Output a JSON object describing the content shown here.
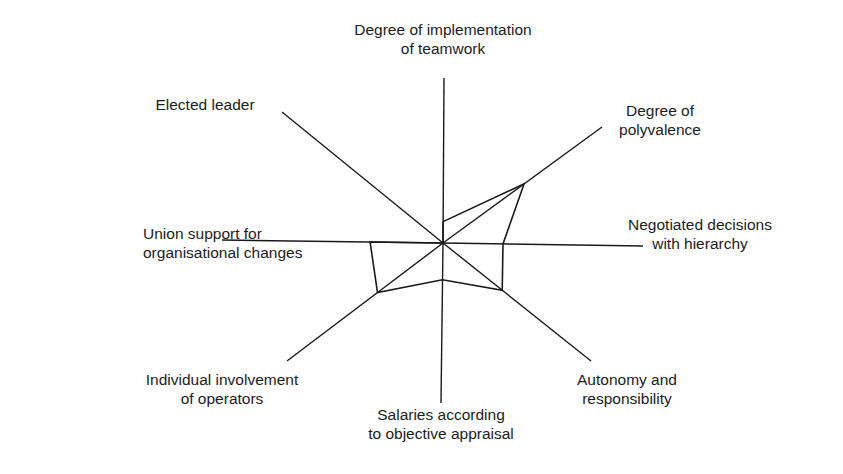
{
  "chart_data": {
    "type": "radar",
    "title": "",
    "center": [
      443,
      243
    ],
    "axes": [
      {
        "name": "Degree of implementation of teamwork",
        "lines": [
          "Degree of implementation",
          "of teamwork"
        ],
        "end": [
          444,
          78
        ],
        "value": 0.13,
        "label_pos": [
          443,
          20
        ],
        "align": "center"
      },
      {
        "name": "Degree of polyvalence",
        "lines": [
          "Degree of",
          "polyvalence"
        ],
        "end": [
          602,
          127
        ],
        "value": 0.51,
        "label_pos": [
          660,
          101
        ],
        "align": "center"
      },
      {
        "name": "Negotiated decisions with hierarchy",
        "lines": [
          "Negotiated decisions",
          "with hierarchy"
        ],
        "end": [
          643,
          246
        ],
        "value": 0.3,
        "label_pos": [
          700,
          215
        ],
        "align": "center"
      },
      {
        "name": "Autonomy and responsibility",
        "lines": [
          "Autonomy and",
          "responsibility"
        ],
        "end": [
          591,
          361
        ],
        "value": 0.4,
        "label_pos": [
          627,
          370
        ],
        "align": "center"
      },
      {
        "name": "Salaries according to objective appraisal",
        "lines": [
          "Salaries according",
          "to objective appraisal"
        ],
        "end": [
          441,
          403
        ],
        "value": 0.23,
        "label_pos": [
          441,
          405
        ],
        "align": "center"
      },
      {
        "name": "Individual involvement of operators",
        "lines": [
          "Individual involvement",
          "of operators"
        ],
        "end": [
          287,
          361
        ],
        "value": 0.42,
        "label_pos": [
          222,
          370
        ],
        "align": "center"
      },
      {
        "name": "Union support for organisational changes",
        "lines": [
          "Union support for",
          "organisational changes"
        ],
        "end": [
          222,
          240
        ],
        "value": 0.33,
        "label_pos": [
          143,
          224
        ],
        "align": "left"
      },
      {
        "name": "Elected leader",
        "lines": [
          "Elected leader"
        ],
        "end": [
          282,
          112
        ],
        "value": 0.0,
        "label_pos": [
          205,
          95
        ],
        "align": "center"
      }
    ],
    "series": [
      {
        "name": "Profile",
        "values": [
          0.13,
          0.51,
          0.3,
          0.4,
          0.23,
          0.42,
          0.33,
          0.0
        ]
      }
    ],
    "grid": false,
    "legend": "none",
    "xlabel": "",
    "ylabel": ""
  },
  "colors": {
    "line": "#1a1a1a",
    "text": "#1c1c1c",
    "background": "#ffffff"
  }
}
